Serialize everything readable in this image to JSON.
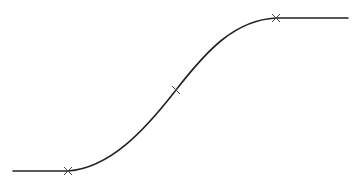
{
  "diagram": {
    "type": "s-curve",
    "stroke_color": "#222222",
    "marker_color": "#444444",
    "curve": {
      "start": [
        13,
        171
      ],
      "lower_marker": [
        68,
        171
      ],
      "inflection_marker": [
        176,
        90
      ],
      "upper_marker": [
        276,
        18
      ],
      "end": [
        348,
        18
      ]
    },
    "markers": [
      {
        "label": "lower-knee",
        "x": 68,
        "y": 171
      },
      {
        "label": "inflection",
        "x": 176,
        "y": 90
      },
      {
        "label": "upper-knee",
        "x": 276,
        "y": 18
      }
    ]
  }
}
